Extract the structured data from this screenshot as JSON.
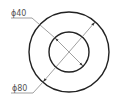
{
  "drawing": {
    "type": "concentric-circles-with-diameter-dimensions",
    "colors": {
      "outline": "#222222",
      "dimension_line": "#777777",
      "text": "#555555",
      "background": "#ffffff"
    },
    "outer_circle": {
      "cx": 69,
      "cy": 52,
      "r": 40
    },
    "inner_circle": {
      "cx": 69,
      "cy": 52,
      "r": 20
    },
    "dimensions": [
      {
        "label": "ϕ40",
        "target": "inner_circle"
      },
      {
        "label": "ϕ80",
        "target": "outer_circle"
      }
    ]
  }
}
